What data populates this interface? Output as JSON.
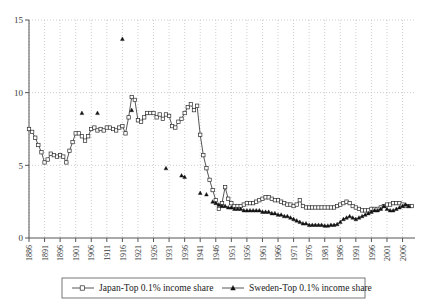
{
  "chart_data": {
    "type": "line",
    "title": "",
    "xlabel": "",
    "ylabel": "",
    "xlim": [
      1886,
      2010
    ],
    "ylim": [
      0,
      15
    ],
    "grid": true,
    "legend_position": "bottom",
    "ytick_labels": [
      "0",
      "5",
      "10",
      "15"
    ],
    "ytick_values": [
      0,
      5,
      10,
      15
    ],
    "xtick_labels": [
      "1886",
      "1891",
      "1896",
      "1901",
      "1906",
      "1911",
      "1916",
      "1921",
      "1926",
      "1931",
      "1936",
      "1941",
      "1946",
      "1951",
      "1956",
      "1961",
      "1966",
      "1971",
      "1976",
      "1981",
      "1986",
      "1991",
      "1996",
      "2001",
      "2006"
    ],
    "xtick_values": [
      1886,
      1891,
      1896,
      1901,
      1906,
      1911,
      1916,
      1921,
      1926,
      1931,
      1936,
      1941,
      1946,
      1951,
      1956,
      1961,
      1966,
      1971,
      1976,
      1981,
      1986,
      1991,
      1996,
      2001,
      2006
    ],
    "series": [
      {
        "name": "Japan-Top 0.1% income share",
        "marker": "square-open",
        "x": [
          1886,
          1887,
          1888,
          1889,
          1890,
          1891,
          1892,
          1893,
          1894,
          1895,
          1896,
          1897,
          1898,
          1899,
          1900,
          1901,
          1902,
          1903,
          1904,
          1905,
          1906,
          1907,
          1908,
          1909,
          1910,
          1911,
          1912,
          1913,
          1914,
          1915,
          1916,
          1917,
          1918,
          1919,
          1920,
          1921,
          1922,
          1923,
          1924,
          1925,
          1926,
          1927,
          1928,
          1929,
          1930,
          1931,
          1932,
          1933,
          1934,
          1935,
          1936,
          1937,
          1938,
          1939,
          1940,
          1941,
          1942,
          1943,
          1944,
          1945,
          1946,
          1947,
          1948,
          1949,
          1950,
          1951,
          1952,
          1953,
          1954,
          1955,
          1956,
          1957,
          1958,
          1959,
          1960,
          1961,
          1962,
          1963,
          1964,
          1965,
          1966,
          1967,
          1968,
          1969,
          1970,
          1971,
          1972,
          1973,
          1974,
          1975,
          1976,
          1977,
          1978,
          1979,
          1980,
          1981,
          1982,
          1983,
          1984,
          1985,
          1986,
          1987,
          1988,
          1989,
          1990,
          1991,
          1992,
          1993,
          1994,
          1995,
          1996,
          1997,
          1998,
          1999,
          2000,
          2001,
          2002,
          2003,
          2004,
          2005,
          2006,
          2007,
          2008,
          2009
        ],
        "y": [
          7.5,
          7.3,
          6.9,
          6.4,
          5.9,
          5.2,
          5.4,
          5.8,
          5.7,
          5.6,
          5.7,
          5.6,
          5.2,
          6.0,
          6.6,
          7.2,
          7.2,
          7.0,
          6.7,
          7.0,
          7.5,
          7.6,
          7.4,
          7.5,
          7.4,
          7.6,
          7.6,
          7.5,
          7.4,
          7.6,
          7.7,
          7.2,
          8.3,
          9.7,
          9.5,
          8.1,
          8.0,
          8.3,
          8.6,
          8.6,
          8.6,
          8.3,
          8.5,
          8.2,
          8.5,
          8.4,
          7.7,
          7.6,
          8.0,
          8.2,
          8.6,
          9.0,
          9.2,
          8.8,
          9.1,
          7.1,
          5.7,
          4.8,
          4.0,
          3.3,
          2.6,
          2.0,
          2.4,
          3.5,
          2.7,
          2.4,
          2.2,
          2.2,
          2.2,
          2.3,
          2.4,
          2.4,
          2.4,
          2.5,
          2.6,
          2.7,
          2.8,
          2.8,
          2.7,
          2.6,
          2.6,
          2.5,
          2.4,
          2.3,
          2.3,
          2.2,
          2.3,
          2.6,
          2.2,
          2.1,
          2.1,
          2.1,
          2.1,
          2.1,
          2.1,
          2.1,
          2.1,
          2.1,
          2.1,
          2.2,
          2.3,
          2.4,
          2.5,
          2.4,
          2.2,
          2.1,
          2.0,
          1.9,
          1.9,
          1.9,
          2.0,
          2.0,
          2.0,
          2.1,
          2.2,
          2.3,
          2.3,
          2.4,
          2.4,
          2.4,
          2.3,
          2.2,
          2.2,
          2.2
        ]
      },
      {
        "name": "Sweden-Top 0.1% income share",
        "marker": "triangle-filled",
        "x": [
          1903,
          1908,
          1916,
          1919,
          1930,
          1935,
          1936,
          1941,
          1943,
          1945,
          1946,
          1947,
          1948,
          1949,
          1950,
          1951,
          1952,
          1953,
          1954,
          1955,
          1956,
          1957,
          1958,
          1959,
          1960,
          1961,
          1962,
          1963,
          1964,
          1965,
          1966,
          1967,
          1968,
          1969,
          1970,
          1971,
          1972,
          1973,
          1974,
          1975,
          1976,
          1977,
          1978,
          1979,
          1980,
          1981,
          1982,
          1983,
          1984,
          1985,
          1986,
          1987,
          1988,
          1989,
          1990,
          1991,
          1992,
          1993,
          1994,
          1995,
          1996,
          1997,
          1998,
          1999,
          2000,
          2001,
          2002,
          2003,
          2004,
          2005,
          2006,
          2007,
          2008
        ],
        "y": [
          8.6,
          8.6,
          13.7,
          8.8,
          4.8,
          4.3,
          4.2,
          3.1,
          3.0,
          2.5,
          2.4,
          2.3,
          2.2,
          2.2,
          2.1,
          2.1,
          2.0,
          2.0,
          2.0,
          1.9,
          1.9,
          1.9,
          1.9,
          1.9,
          1.9,
          1.8,
          1.8,
          1.8,
          1.7,
          1.7,
          1.6,
          1.6,
          1.5,
          1.5,
          1.4,
          1.3,
          1.2,
          1.1,
          1.0,
          1.0,
          0.9,
          0.9,
          0.9,
          0.9,
          0.9,
          0.85,
          0.85,
          0.9,
          0.9,
          0.95,
          1.1,
          1.3,
          1.4,
          1.5,
          1.4,
          1.3,
          1.4,
          1.5,
          1.6,
          1.7,
          1.8,
          1.9,
          1.9,
          2.0,
          2.2,
          2.0,
          1.9,
          1.9,
          2.0,
          2.1,
          2.2,
          2.3,
          2.2
        ]
      }
    ]
  },
  "legend": {
    "items": [
      {
        "label": "Japan-Top 0.1% income share",
        "marker": "square-open"
      },
      {
        "label": "Sweden-Top 0.1% income share",
        "marker": "triangle-filled"
      }
    ]
  }
}
